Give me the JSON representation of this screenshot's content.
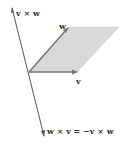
{
  "diagram": {
    "labels": {
      "v_cross_w": "v × w",
      "w": "w",
      "v": "v",
      "w_cross_v": "w × v = −v × w"
    },
    "colors": {
      "parallelogram_fill": "#d9d9d9",
      "vector_stroke": "#666666",
      "axis_stroke": "#555555",
      "text": "#333333"
    }
  }
}
